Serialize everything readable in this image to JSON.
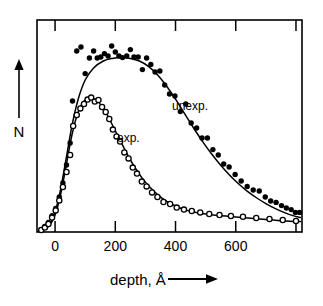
{
  "figure": {
    "yaxis_label": "N",
    "yaxis_arrow_icon": "up-arrow-icon",
    "xaxis_label": "depth, Å",
    "xaxis_arrow_icon": "right-arrow-icon"
  },
  "chart_data": {
    "type": "scatter",
    "title": "",
    "xlabel": "depth, Å",
    "ylabel": "N",
    "xlim": [
      -60,
      820
    ],
    "ylim": [
      0,
      1.06
    ],
    "grid": false,
    "legend": "inline-annotations",
    "xticks": [
      0,
      200,
      400,
      600,
      800
    ],
    "xticklabels": [
      "0",
      "200",
      "400",
      "600",
      ""
    ],
    "yticks": [],
    "yticklabels": [],
    "annotations": [
      {
        "text": "unexp.",
        "x": 450,
        "y": 0.7
      },
      {
        "text": "exp.",
        "x": 268,
        "y": 0.545
      }
    ],
    "series": [
      {
        "name": "unexp.",
        "marker": "filled-circle",
        "curve_x": [
          -42,
          -20,
          0,
          18,
          36,
          56,
          76,
          100,
          128,
          160,
          190,
          220,
          250,
          280,
          310,
          340,
          370,
          400,
          430,
          460,
          490,
          520,
          550,
          580,
          610,
          640,
          670,
          700,
          730,
          760,
          790,
          815
        ],
        "curve_y": [
          0.01,
          0.035,
          0.1,
          0.21,
          0.36,
          0.53,
          0.66,
          0.76,
          0.82,
          0.855,
          0.868,
          0.872,
          0.868,
          0.855,
          0.828,
          0.786,
          0.73,
          0.664,
          0.592,
          0.52,
          0.452,
          0.39,
          0.334,
          0.284,
          0.24,
          0.202,
          0.17,
          0.142,
          0.118,
          0.098,
          0.082,
          0.072
        ],
        "points_x": [
          -46,
          -34,
          -22,
          -10,
          2,
          14,
          26,
          38,
          50,
          58,
          72,
          86,
          100,
          114,
          128,
          140,
          152,
          164,
          176,
          188,
          200,
          212,
          224,
          238,
          250,
          262,
          276,
          290,
          304,
          318,
          332,
          348,
          364,
          380,
          398,
          416,
          434,
          452,
          470,
          488,
          506,
          524,
          542,
          560,
          578,
          598,
          618,
          638,
          658,
          678,
          698,
          716,
          734,
          752,
          768,
          784,
          798,
          812
        ],
        "points_y": [
          0.012,
          0.028,
          0.048,
          0.082,
          0.118,
          0.175,
          0.245,
          0.335,
          0.445,
          0.655,
          0.905,
          0.925,
          0.792,
          0.87,
          0.905,
          0.87,
          0.875,
          0.892,
          0.88,
          0.93,
          0.9,
          0.88,
          0.872,
          0.88,
          0.912,
          0.875,
          0.875,
          0.812,
          0.87,
          0.838,
          0.8,
          0.805,
          0.735,
          0.69,
          0.68,
          0.602,
          0.64,
          0.545,
          0.52,
          0.47,
          0.47,
          0.412,
          0.385,
          0.34,
          0.325,
          0.288,
          0.255,
          0.228,
          0.21,
          0.205,
          0.175,
          0.155,
          0.148,
          0.132,
          0.12,
          0.112,
          0.098,
          0.098
        ]
      },
      {
        "name": "exp.",
        "marker": "open-circle",
        "curve_x": [
          -42,
          -20,
          0,
          18,
          36,
          56,
          76,
          96,
          116,
          136,
          156,
          176,
          196,
          216,
          240,
          264,
          290,
          316,
          344,
          372,
          400,
          430,
          460,
          500,
          540,
          580,
          620,
          660,
          700,
          740,
          780,
          815
        ],
        "curve_y": [
          0.01,
          0.03,
          0.085,
          0.185,
          0.325,
          0.485,
          0.598,
          0.655,
          0.67,
          0.66,
          0.628,
          0.578,
          0.518,
          0.458,
          0.388,
          0.325,
          0.268,
          0.222,
          0.182,
          0.152,
          0.13,
          0.112,
          0.1,
          0.09,
          0.083,
          0.078,
          0.073,
          0.068,
          0.063,
          0.058,
          0.054,
          0.052
        ],
        "points_x": [
          -46,
          -34,
          -22,
          -10,
          2,
          14,
          26,
          38,
          50,
          60,
          72,
          84,
          96,
          108,
          120,
          132,
          144,
          156,
          168,
          180,
          192,
          204,
          216,
          230,
          244,
          258,
          272,
          288,
          304,
          322,
          340,
          360,
          382,
          404,
          428,
          454,
          482,
          512,
          546,
          584,
          624,
          668,
          712,
          756,
          800
        ],
        "points_y": [
          0.01,
          0.022,
          0.04,
          0.072,
          0.108,
          0.158,
          0.225,
          0.3,
          0.385,
          0.53,
          0.585,
          0.618,
          0.64,
          0.662,
          0.672,
          0.652,
          0.66,
          0.625,
          0.6,
          0.565,
          0.512,
          0.478,
          0.452,
          0.398,
          0.368,
          0.322,
          0.292,
          0.252,
          0.228,
          0.198,
          0.175,
          0.15,
          0.14,
          0.122,
          0.112,
          0.105,
          0.098,
          0.09,
          0.085,
          0.08,
          0.076,
          0.07,
          0.065,
          0.06,
          0.055
        ]
      }
    ]
  }
}
